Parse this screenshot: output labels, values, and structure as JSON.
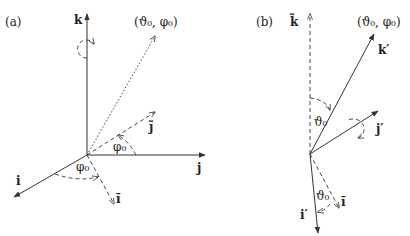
{
  "panels": [
    {
      "id": "a",
      "label": "(a)",
      "direction_label": "(ϑ₀, φ₀)",
      "axes": {
        "k": "k",
        "j": "j",
        "i": "i"
      },
      "rotated_axes": {
        "j_tilde": "j̃",
        "i_tilde": "ĩ"
      },
      "angles": {
        "phi_upper": "φ₀",
        "phi_lower": "φ₀"
      }
    },
    {
      "id": "b",
      "label": "(b)",
      "direction_label": "(ϑ₀, φ₀)",
      "axes": {
        "k_tilde": "k̃",
        "k_prime": "k′",
        "j_prime": "j′",
        "i_prime": "i′",
        "i_tilde": "ĩ"
      },
      "angles": {
        "theta_upper": "ϑ₀",
        "theta_lower": "ϑ₀"
      }
    }
  ]
}
